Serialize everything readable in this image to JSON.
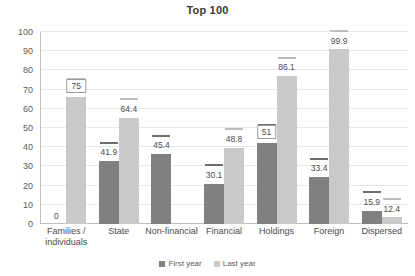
{
  "chart_data": {
    "type": "bar",
    "title": "Top 100",
    "xlabel": "",
    "ylabel": "",
    "ylim": [
      0,
      100
    ],
    "ytick_step": 10,
    "yticks": [
      100,
      90,
      80,
      70,
      60,
      50,
      40,
      30,
      20,
      10,
      0
    ],
    "grid": true,
    "legend_position": "bottom-center",
    "categories": [
      "Families / individuals",
      "State",
      "Non-financial",
      "Financial",
      "Holdings",
      "Foreign",
      "Dispersed"
    ],
    "series": [
      {
        "name": "First year",
        "color": "#808080",
        "values": [
          0,
          41.9,
          45.4,
          30.1,
          51,
          33.4,
          15.9
        ],
        "labels": [
          "0",
          "41.9",
          "45.4",
          "30.1",
          "51",
          "33.4",
          "15.9"
        ]
      },
      {
        "name": "Last year",
        "color": "#c9c9c9",
        "values": [
          75,
          64.4,
          0,
          48.8,
          86.1,
          99.9,
          12.4
        ],
        "labels": [
          "75",
          "64.4",
          "",
          "48.8",
          "86.1",
          "99.9",
          "12.4"
        ]
      }
    ],
    "boxed_labels": [
      "75",
      "51"
    ]
  },
  "title": {
    "text": "Top 100"
  },
  "axis": {
    "y_tick_labels": [
      "100",
      "90",
      "80",
      "70",
      "60",
      "50",
      "40",
      "30",
      "20",
      "10",
      "0"
    ]
  },
  "categories": [
    {
      "line1": "Families /",
      "line2": "individuals"
    },
    {
      "line1": "State",
      "line2": ""
    },
    {
      "line1": "Non-financial",
      "line2": ""
    },
    {
      "line1": "Financial",
      "line2": ""
    },
    {
      "line1": "Holdings",
      "line2": ""
    },
    {
      "line1": "Foreign",
      "line2": ""
    },
    {
      "line1": "Dispersed",
      "line2": ""
    }
  ],
  "legend": {
    "items": [
      {
        "label": "First year",
        "color": "#808080"
      },
      {
        "label": "Last year",
        "color": "#c9c9c9"
      }
    ]
  }
}
